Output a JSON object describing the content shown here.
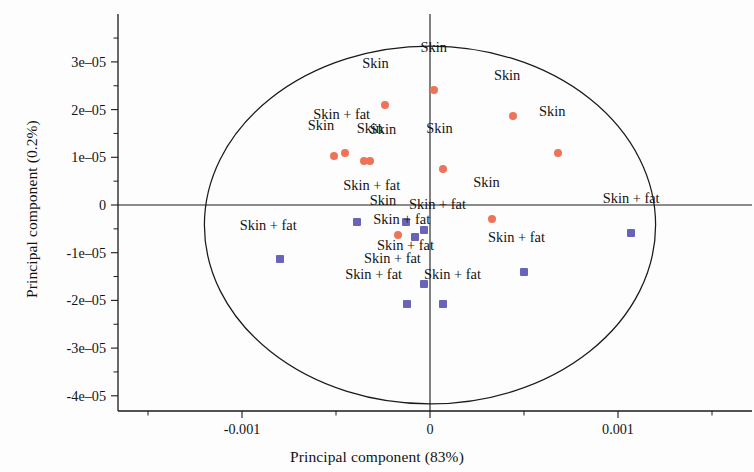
{
  "chart_data": {
    "type": "scatter",
    "title": "",
    "xlabel": "Principal component (83%)",
    "ylabel": "Principal component (0.2%)",
    "xlim": [
      -0.0016,
      0.0017
    ],
    "ylim": [
      -4.55e-05,
      3.55e-05
    ],
    "xticks": [
      -0.001,
      0,
      0.001
    ],
    "xtick_labels": [
      "-0.001",
      "0",
      "0.001"
    ],
    "xminorticks": [
      -0.0015,
      -0.0005,
      0.0005,
      0.0015
    ],
    "yticks": [
      3e-05,
      2e-05,
      1e-05,
      0,
      -1e-05,
      -2e-05,
      -3e-05,
      -4e-05
    ],
    "ytick_labels": [
      "3e–05",
      "2e–05",
      "1e–05",
      "0",
      "-1e–05",
      "-2e–05",
      "-3e–05",
      "-4e–05"
    ],
    "grid": false,
    "legend": "none",
    "annotations": {
      "confidence_ellipse": {
        "center_x": 0.0,
        "center_y": -4.2e-06,
        "radius_x": 0.0012,
        "radius_y": 3.75e-05,
        "stroke": "#1a1a1a"
      },
      "origin_crosshair": true
    },
    "series": [
      {
        "name": "Skin",
        "marker": "circle",
        "color": "#ee7358",
        "label_text": "Skin",
        "points": [
          {
            "x": 2e-05,
            "y": 2.42e-05,
            "label": "Skin",
            "lx": 2e-05,
            "ly": 3.12e-05
          },
          {
            "x": -0.00024,
            "y": 2.09e-05,
            "label": "Skin",
            "lx": -0.00029,
            "ly": 2.78e-05
          },
          {
            "x": 0.00044,
            "y": 1.86e-05,
            "label": "Skin",
            "lx": 0.00041,
            "ly": 2.53e-05
          },
          {
            "x": 0.00068,
            "y": 1.09e-05,
            "label": "Skin",
            "lx": 0.00065,
            "ly": 1.78e-05
          },
          {
            "x": 7e-05,
            "y": 7.5e-06,
            "label": "Skin",
            "lx": 5e-05,
            "ly": 1.43e-05
          },
          {
            "x": -0.00051,
            "y": 1.02e-05,
            "label": "Skin",
            "lx": -0.00058,
            "ly": 1.48e-05
          },
          {
            "x": -0.00045,
            "y": 1.08e-05,
            "label": "Skin + fat",
            "lx": -0.00047,
            "ly": 1.72e-05
          },
          {
            "x": -0.00035,
            "y": 9.2e-06,
            "label": "Skin",
            "lx": -0.00032,
            "ly": 1.43e-05
          },
          {
            "x": -0.00032,
            "y": 9.3e-06,
            "label": "Skin",
            "lx": -0.00025,
            "ly": 1.4e-05
          },
          {
            "x": 0.00033,
            "y": -3e-06,
            "label": "Skin",
            "lx": 0.0003,
            "ly": 3e-06
          },
          {
            "x": -0.00017,
            "y": -6.2e-06,
            "label": "Skin",
            "lx": -0.00025,
            "ly": -8e-07
          }
        ]
      },
      {
        "name": "Skin + fat",
        "marker": "square",
        "color": "#6a64b8",
        "label_text": "Skin + fat",
        "points": [
          {
            "x": -0.00039,
            "y": -3.6e-06,
            "label": "Skin + fat",
            "lx": -0.00031,
            "ly": 2.4e-06
          },
          {
            "x": -0.00013,
            "y": -3.5e-06,
            "label": "Skin + fat",
            "lx": 4e-05,
            "ly": -1.7e-06
          },
          {
            "x": -3e-05,
            "y": -5.3e-06,
            "label": "Skin + fat",
            "lx": -0.00015,
            "ly": -4.8e-06
          },
          {
            "x": -8e-05,
            "y": -6.7e-06,
            "label": "Skin + fat",
            "lx": -0.00013,
            "ly": -1.02e-05
          },
          {
            "x": -0.0008,
            "y": -1.13e-05,
            "label": "Skin + fat",
            "lx": -0.00086,
            "ly": -6e-06
          },
          {
            "x": 0.0005,
            "y": -1.4e-05,
            "label": "Skin + fat",
            "lx": 0.00046,
            "ly": -8.6e-06
          },
          {
            "x": -3e-05,
            "y": -1.65e-05,
            "label": "Skin + fat",
            "lx": -0.0002,
            "ly": -1.29e-05
          },
          {
            "x": -0.00012,
            "y": -2.07e-05,
            "label": "Skin + fat",
            "lx": -0.0003,
            "ly": -1.63e-05
          },
          {
            "x": 7e-05,
            "y": -2.07e-05,
            "label": "Skin + fat",
            "lx": 0.00012,
            "ly": -1.63e-05
          },
          {
            "x": 0.00107,
            "y": -5.8e-06,
            "label": "Skin + fat",
            "lx": 0.00107,
            "ly": -5e-07
          }
        ]
      }
    ]
  },
  "colors": {
    "skin_marker": "#ee7358",
    "skin_fat_marker": "#6a64b8",
    "axis": "#1a1a1a",
    "text": "#131313",
    "background": "#fdfdfd"
  }
}
